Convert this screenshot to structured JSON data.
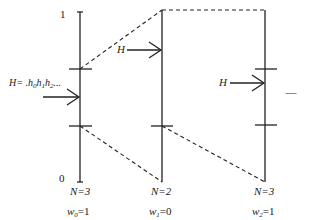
{
  "diagram": {
    "axis_top_label": "1",
    "axis_bottom_label": "0",
    "input_label_prefix": "H= .",
    "input_label_digits": [
      {
        "h": "h",
        "sub": "0"
      },
      {
        "h": "h",
        "sub": "1"
      },
      {
        "h": "h",
        "sub": "2"
      }
    ],
    "input_label_suffix": "...",
    "arrow_label": "H",
    "ellipsis": "...........",
    "columns": [
      {
        "n_label": "N=3",
        "w_name": "w",
        "w_sub": "0",
        "w_value": "=1"
      },
      {
        "n_label": "N=2",
        "w_name": "w",
        "w_sub": "1",
        "w_value": "=0"
      },
      {
        "n_label": "N=3",
        "w_name": "w",
        "w_sub": "2",
        "w_value": "=1"
      }
    ],
    "colors": {
      "line": "#222222",
      "background": "#ffffff"
    }
  }
}
